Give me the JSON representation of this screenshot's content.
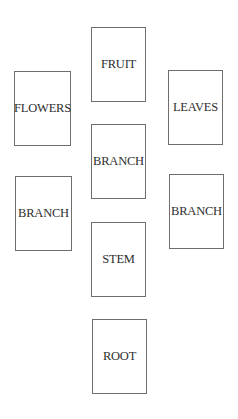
{
  "diagram": {
    "type": "tree-parts-cards",
    "cards": {
      "fruit": "FRUIT",
      "flowers": "FLOWERS",
      "leaves": "LEAVES",
      "branch_center": "BRANCH",
      "branch_left": "BRANCH",
      "branch_right": "BRANCH",
      "stem": "STEM",
      "root": "ROOT"
    },
    "colors": {
      "border": "#6e6e6e",
      "text": "#2e2e2e",
      "background": "#ffffff"
    }
  }
}
